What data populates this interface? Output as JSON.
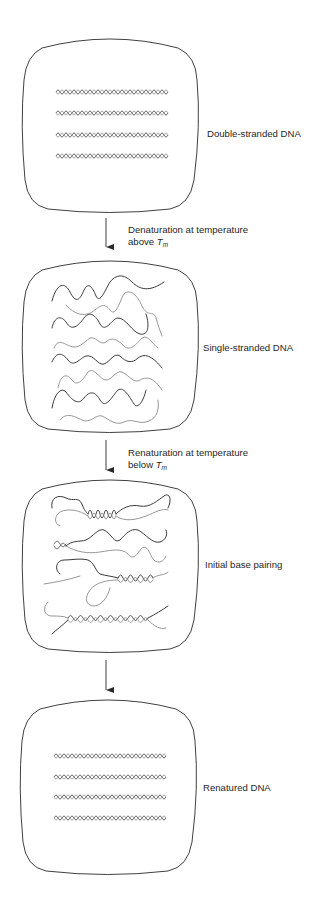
{
  "figure": {
    "stages": [
      {
        "id": "double-stranded",
        "label": "Double-stranded DNA",
        "box": {
          "x": 22,
          "y": 37,
          "w": 176,
          "h": 176
        },
        "label_pos": {
          "x": 207,
          "y": 127
        }
      },
      {
        "id": "single-stranded",
        "label": "Single-stranded DNA",
        "box": {
          "x": 22,
          "y": 259,
          "w": 176,
          "h": 174
        },
        "label_pos": {
          "x": 203,
          "y": 341
        }
      },
      {
        "id": "initial-base-pairing",
        "label": "Initial base pairing",
        "box": {
          "x": 22,
          "y": 478,
          "w": 176,
          "h": 175
        },
        "label_pos": {
          "x": 205,
          "y": 558
        }
      },
      {
        "id": "renatured",
        "label": "Renatured DNA",
        "box": {
          "x": 20,
          "y": 698,
          "w": 176,
          "h": 177
        },
        "label_pos": {
          "x": 203,
          "y": 781
        }
      }
    ],
    "transitions": [
      {
        "id": "denaturation",
        "line1": "Denaturation at temperature",
        "line2_prefix": "above ",
        "symbol": "T",
        "subscript": "m",
        "arrow": {
          "x": 106,
          "y1": 218,
          "y2": 247
        },
        "label_pos": {
          "x": 128,
          "y": 225
        }
      },
      {
        "id": "renaturation",
        "line1": "Renaturation at temperature",
        "line2_prefix": "below ",
        "symbol": "T",
        "subscript": "m",
        "arrow": {
          "x": 106,
          "y1": 440,
          "y2": 470
        },
        "label_pos": {
          "x": 128,
          "y": 448
        }
      },
      {
        "id": "completion",
        "arrow": {
          "x": 106,
          "y1": 660,
          "y2": 690
        }
      }
    ],
    "colors": {
      "outline": "#2a2a2a",
      "strand_dark": "#3a3a3a",
      "strand_light": "#8a8a8a",
      "text": "#1f1f1f"
    }
  }
}
